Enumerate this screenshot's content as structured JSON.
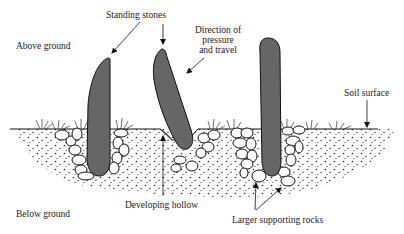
{
  "diagram": {
    "labels": {
      "standing_stones": "Standing stones",
      "direction_line1": "Direction of",
      "direction_line2": "pressure",
      "direction_line3": "and travel",
      "above_ground": "Above ground",
      "soil_surface": "Soil surface",
      "below_ground": "Below ground",
      "developing_hollow": "Developing hollow",
      "larger_supporting_rocks": "Larger supporting rocks"
    },
    "colors": {
      "stone_fill": "#666666",
      "outline": "#111111",
      "background": "#ffffff"
    },
    "stones": [
      {
        "name": "left-stone",
        "state": "upright"
      },
      {
        "name": "middle-stone",
        "state": "tilted"
      },
      {
        "name": "right-stone",
        "state": "upright"
      }
    ]
  }
}
